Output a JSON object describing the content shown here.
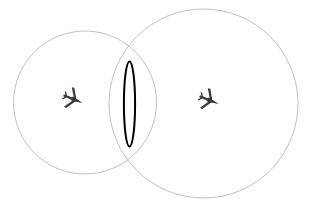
{
  "canvas": {
    "width": 315,
    "height": 205,
    "background_color": "#ffffff"
  },
  "diagram": {
    "kind": "two-overlapping-circles-with-lens-intersection",
    "circle_stroke_color": "#b0b0b0",
    "circle_stroke_width": 0.8,
    "circle_fill": "none",
    "lens_stroke_color": "#000000",
    "lens_stroke_width": 2.0,
    "lens_fill": "#ffffff",
    "aircraft_color": "#3a3a3a",
    "shapes": [
      {
        "name": "left-circle",
        "type": "circle",
        "cx": 85,
        "cy": 102.5,
        "r": 71.5
      },
      {
        "name": "right-circle",
        "type": "circle",
        "cx": 203.5,
        "cy": 103.5,
        "r": 94.5
      },
      {
        "name": "intersection-lens",
        "type": "ellipse",
        "cx": 129.5,
        "cy": 104,
        "rx": 5.6,
        "ry": 42.5
      }
    ],
    "markers": [
      {
        "name": "aircraft-marker-left",
        "type": "aircraft",
        "cx": 73,
        "cy": 99,
        "rotation_deg": 22,
        "scale": 1.0
      },
      {
        "name": "aircraft-marker-right",
        "type": "aircraft",
        "cx": 209,
        "cy": 100,
        "rotation_deg": 22,
        "scale": 1.0
      }
    ]
  }
}
